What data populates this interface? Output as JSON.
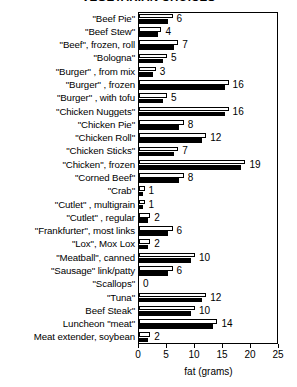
{
  "chart_data": {
    "type": "bar",
    "orientation": "horizontal",
    "title": "VEGETARIAN CHOICES",
    "xlabel": "fat (grams)",
    "ylabel": "",
    "xlim": [
      0,
      25
    ],
    "xticks": [
      0,
      5,
      10,
      15,
      20,
      25
    ],
    "grid": false,
    "legend": null,
    "categories": [
      "\"Beef Pie\"",
      "\"Beef Stew\"",
      "\"Beef\", frozen, roll",
      "\"Bologna\"",
      "\"Burger\" , from mix",
      "\"Burger\" , frozen",
      "\"Burger\" , with tofu",
      "\"Chicken Nuggets\"",
      "\"Chicken Pie\"",
      "\"Chicken Roll\"",
      "\"Chicken Sticks\"",
      "\"Chicken\", frozen",
      "\"Corned Beef\"",
      "\"Crab\"",
      "\"Cutlet\" , multigrain",
      "\"Cutlet\" , regular",
      "\"Frankfurter\", most links",
      "\"Lox\", Mox Lox",
      "\"Meatball\", canned",
      "\"Sausage\" link/patty",
      "\"Scallops\"",
      "\"Tuna\"",
      "Beef Steak\"",
      "Luncheon \"meat\"",
      "Meat extender, soybean"
    ],
    "values": [
      6,
      4,
      7,
      5,
      3,
      16,
      5,
      16,
      8,
      12,
      7,
      19,
      8,
      1,
      1,
      2,
      6,
      2,
      10,
      6,
      0,
      12,
      10,
      14,
      2
    ],
    "value_labels": [
      "6",
      "4",
      "7",
      "5",
      "3",
      "16",
      "5",
      "16",
      "8",
      "12",
      "7",
      "19",
      "8",
      "1",
      "1",
      "2",
      "6",
      "2",
      "10",
      "6",
      "0",
      "12",
      "10",
      "14",
      "2"
    ],
    "series": [
      {
        "name": "white-bar",
        "fill": "#ffffff",
        "values": [
          6,
          4,
          7,
          5,
          3,
          16,
          5,
          16,
          8,
          12,
          7,
          19,
          8,
          1,
          1,
          2,
          6,
          2,
          10,
          6,
          0,
          12,
          10,
          14,
          2
        ]
      },
      {
        "name": "black-bar",
        "fill": "#000000",
        "values": [
          5.2,
          3.4,
          6.2,
          4.2,
          2.5,
          15.3,
          4.2,
          15.3,
          7.1,
          11.2,
          6.2,
          18.2,
          7.1,
          0.8,
          0.8,
          1.6,
          5.2,
          1.6,
          9.2,
          5.2,
          0,
          11.2,
          9.2,
          13.2,
          1.6
        ]
      }
    ],
    "colors": {
      "bar_white": "#ffffff",
      "bar_black": "#000000",
      "outline": "#000000",
      "background": "#ffffff"
    }
  }
}
